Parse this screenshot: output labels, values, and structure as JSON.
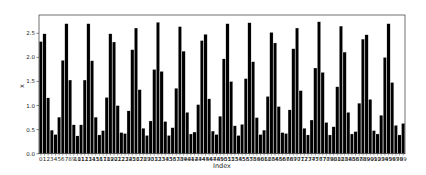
{
  "chart_data": {
    "type": "bar",
    "title": "",
    "xlabel": "Index",
    "ylabel": "x",
    "ylim": [
      0,
      2.88
    ],
    "yticks": [
      "0.0",
      "0.5",
      "1.0",
      "1.5",
      "2.0",
      "2.5"
    ],
    "grid": false,
    "legend": null,
    "bar_color": "#000000",
    "edge_color": "#ffffff",
    "categories": [
      0,
      1,
      2,
      3,
      4,
      5,
      6,
      7,
      8,
      9,
      10,
      11,
      12,
      13,
      14,
      15,
      16,
      17,
      18,
      19,
      20,
      21,
      22,
      23,
      24,
      25,
      26,
      27,
      28,
      29,
      30,
      31,
      32,
      33,
      34,
      35,
      36,
      37,
      38,
      39,
      40,
      41,
      42,
      43,
      44,
      45,
      46,
      47,
      48,
      49,
      50,
      51,
      52,
      53,
      54,
      55,
      56,
      57,
      58,
      59,
      60,
      61,
      62,
      63,
      64,
      65,
      66,
      67,
      68,
      69,
      70,
      71,
      72,
      73,
      74,
      75,
      76,
      77,
      78,
      79,
      80,
      81,
      82,
      83,
      84,
      85,
      86,
      87,
      88,
      89,
      90,
      91,
      92,
      93,
      94,
      95,
      96,
      97,
      98,
      99
    ],
    "values": [
      2.33,
      2.49,
      1.16,
      0.49,
      0.4,
      0.76,
      1.94,
      2.7,
      1.53,
      0.6,
      0.37,
      0.6,
      1.53,
      2.7,
      1.93,
      0.76,
      0.39,
      0.48,
      1.17,
      2.49,
      2.32,
      1.0,
      0.44,
      0.42,
      0.89,
      2.16,
      2.61,
      1.33,
      0.53,
      0.38,
      0.68,
      1.75,
      2.73,
      1.71,
      0.67,
      0.38,
      0.54,
      1.36,
      2.64,
      2.13,
      0.86,
      0.41,
      0.45,
      1.02,
      2.35,
      2.48,
      1.14,
      0.47,
      0.4,
      0.78,
      1.97,
      2.7,
      1.5,
      0.58,
      0.38,
      0.61,
      1.56,
      2.72,
      1.91,
      0.75,
      0.4,
      0.49,
      1.19,
      2.52,
      2.3,
      0.98,
      0.44,
      0.42,
      0.91,
      2.18,
      2.61,
      1.31,
      0.53,
      0.39,
      0.7,
      1.78,
      2.74,
      1.69,
      0.65,
      0.39,
      0.56,
      1.39,
      2.65,
      2.11,
      0.86,
      0.41,
      0.46,
      1.05,
      2.38,
      2.47,
      1.13,
      0.48,
      0.41,
      0.8,
      2.0,
      2.7,
      1.48,
      0.59,
      0.39,
      0.63
    ]
  }
}
